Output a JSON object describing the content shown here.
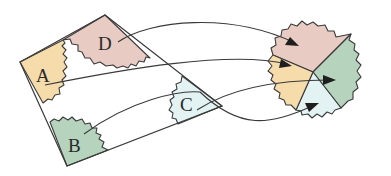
{
  "diagram": {
    "pieces": [
      {
        "id": "A",
        "label": "A",
        "color": "#f6dcaa"
      },
      {
        "id": "B",
        "label": "B",
        "color": "#b5d3bd"
      },
      {
        "id": "C",
        "label": "C",
        "color": "#e3f2f2"
      },
      {
        "id": "D",
        "label": "D",
        "color": "#e8cbc3"
      }
    ],
    "outline_color": "#3a3a3a",
    "arrows": [
      {
        "from": "D",
        "to": "D"
      },
      {
        "from": "A",
        "to": "A"
      },
      {
        "from": "C",
        "to": "B"
      },
      {
        "from": "B",
        "to": "C"
      }
    ]
  }
}
